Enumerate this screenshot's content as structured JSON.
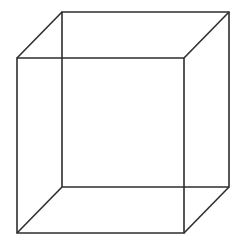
{
  "figure": {
    "name": "necker-cube",
    "type": "line-drawing",
    "canvas": {
      "width": 245,
      "height": 247,
      "background_color": "#ffffff"
    },
    "style": {
      "stroke_color": "#2e2e2e",
      "stroke_width": 1.6,
      "fill": "none"
    },
    "projection": {
      "kind": "oblique-parallel",
      "depth_offset_x": 45,
      "depth_offset_y": -46
    },
    "vertices": {
      "front_top_left": {
        "x": 17,
        "y": 58
      },
      "front_top_right": {
        "x": 184,
        "y": 58
      },
      "front_bottom_right": {
        "x": 184,
        "y": 233
      },
      "front_bottom_left": {
        "x": 17,
        "y": 233
      },
      "back_top_left": {
        "x": 62,
        "y": 12
      },
      "back_top_right": {
        "x": 229,
        "y": 12
      },
      "back_bottom_right": {
        "x": 229,
        "y": 187
      },
      "back_bottom_left": {
        "x": 62,
        "y": 187
      }
    },
    "edges": {
      "front_face_path": "M 17 58 L 184 58 L 184 233 L 17 233 Z",
      "back_face_path": "M 62 12 L 229 12 L 229 187 L 62 187 Z",
      "connector_top_left_path": "M 17 58 L 62 12",
      "connector_top_right_path": "M 184 58 L 229 12",
      "connector_bottom_right_path": "M 184 233 L 229 187",
      "connector_bottom_left_path": "M 17 233 L 62 187"
    },
    "edge_labels": {
      "front_face": "front square face",
      "back_face": "back square face",
      "connector_top_left": "top-left depth connector",
      "connector_top_right": "top-right depth connector",
      "connector_bottom_right": "bottom-right depth connector",
      "connector_bottom_left": "bottom-left depth connector"
    }
  }
}
